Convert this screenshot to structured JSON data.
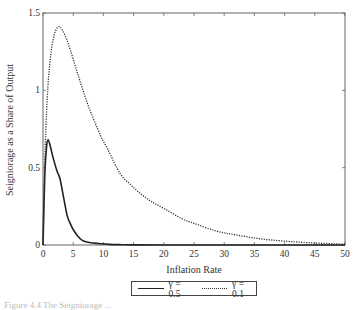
{
  "chart_data": {
    "type": "line",
    "title": "",
    "xlabel": "Inflation Rate",
    "ylabel": "Seigniorage as a Share of Output",
    "xlim": [
      0,
      50
    ],
    "ylim": [
      0,
      1.5
    ],
    "xticks": [
      0,
      5,
      10,
      15,
      20,
      25,
      30,
      35,
      40,
      45,
      50
    ],
    "yticks": [
      0,
      0.5,
      1,
      1.5
    ],
    "ytick_labels": [
      "0",
      "0.5",
      "1",
      "1.5"
    ],
    "grid": false,
    "legend_position": "bottom-center-outside",
    "series": [
      {
        "name": "γ = 0.5",
        "style": "solid",
        "x": [
          0,
          0.3,
          0.6,
          0.85,
          1.2,
          1.7,
          2.3,
          2.8,
          3.4,
          4.0,
          4.5,
          5.0,
          5.7,
          6.5,
          7.5,
          8.5,
          9.5,
          11,
          13,
          15,
          20,
          30,
          40,
          50
        ],
        "y": [
          0,
          0.45,
          0.64,
          0.68,
          0.64,
          0.56,
          0.48,
          0.43,
          0.31,
          0.19,
          0.14,
          0.1,
          0.06,
          0.03,
          0.018,
          0.012,
          0.008,
          0.004,
          0.002,
          0.001,
          0,
          0,
          0,
          0
        ]
      },
      {
        "name": "γ = 0.1",
        "style": "dotted",
        "x": [
          0,
          0.3,
          0.7,
          1.2,
          1.8,
          2.5,
          3.2,
          4.2,
          5.8,
          7.5,
          9.5,
          10.7,
          12.8,
          14.5,
          16.2,
          18,
          20.3,
          23,
          25,
          28.7,
          32,
          36,
          40,
          44,
          48,
          50
        ],
        "y": [
          0,
          0.55,
          0.95,
          1.2,
          1.35,
          1.41,
          1.39,
          1.3,
          1.1,
          0.9,
          0.71,
          0.62,
          0.46,
          0.39,
          0.33,
          0.28,
          0.23,
          0.17,
          0.14,
          0.09,
          0.065,
          0.04,
          0.025,
          0.015,
          0.008,
          0.005
        ]
      }
    ]
  },
  "axes": {
    "xlabel": "Inflation Rate",
    "ylabel": "Seigniorage as a Share of Output"
  },
  "legend": {
    "items": [
      {
        "label": "γ = 0.5",
        "style": "solid"
      },
      {
        "label": "γ = 0.1",
        "style": "dotted"
      }
    ]
  },
  "caption": {
    "text": "Figure 4.4  The Seigniorage ..."
  }
}
